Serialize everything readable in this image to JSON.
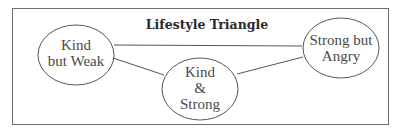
{
  "diagram": {
    "title": "Lifestyle Triangle",
    "nodes": [
      {
        "id": "kind-but-weak",
        "lines": [
          "Kind",
          "but Weak"
        ]
      },
      {
        "id": "kind-and-strong",
        "lines": [
          "Kind",
          "&",
          "Strong"
        ]
      },
      {
        "id": "strong-but-angry",
        "lines": [
          "Strong but",
          "Angry"
        ]
      }
    ],
    "edges": [
      {
        "from": "kind-but-weak",
        "to": "strong-but-angry"
      },
      {
        "from": "kind-but-weak",
        "to": "kind-and-strong"
      },
      {
        "from": "kind-and-strong",
        "to": "strong-but-angry"
      }
    ]
  }
}
